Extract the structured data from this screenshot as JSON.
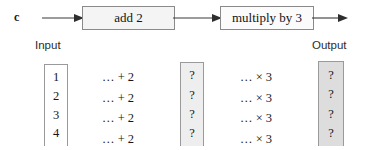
{
  "figure": {
    "part_label": "c",
    "background_color": "#ffffff"
  },
  "flow": {
    "boxes": [
      {
        "id": "add2",
        "label": "add 2",
        "fill": "#f4f4f4",
        "border": "#8a8a8a"
      },
      {
        "id": "mult3",
        "label": "multiply by 3",
        "fill": "#fbfbfb",
        "border": "#8a8a8a"
      }
    ],
    "arrows": [
      {
        "id": "arrow-in",
        "name": "input-arrow"
      },
      {
        "id": "arrow-mid",
        "name": "intermediate-arrow"
      },
      {
        "id": "arrow-out",
        "name": "output-arrow"
      }
    ]
  },
  "captions": {
    "input": "Input",
    "output": "Output"
  },
  "table": {
    "input_values": [
      "1",
      "2",
      "3",
      "4"
    ],
    "add_operations": [
      "… + 2",
      "… + 2",
      "… + 2",
      "… + 2"
    ],
    "intermediate_values": [
      "?",
      "?",
      "?",
      "?"
    ],
    "multiply_operations": [
      "… × 3",
      "… × 3",
      "… × 3",
      "… × 3"
    ],
    "output_values": [
      "?",
      "?",
      "?",
      "?"
    ]
  },
  "colors": {
    "input_column_fill": "#ffffff",
    "middle_column_fill": "#eeeeee",
    "output_column_fill": "#dddddd",
    "stroke": "#404040",
    "text": "#171717"
  }
}
